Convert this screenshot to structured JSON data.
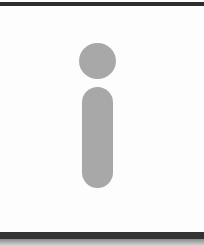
{
  "icon": {
    "name": "info",
    "glyph": "i",
    "color": "#a8a8a8"
  },
  "frame": {
    "background": "#fdfdfd",
    "top_border_color": "#2e2e2e",
    "bottom_border_color": "#333333"
  }
}
